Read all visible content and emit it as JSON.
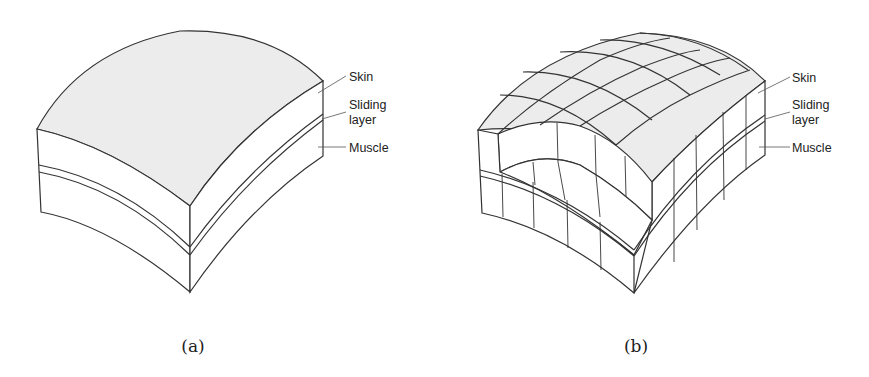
{
  "figure": {
    "panels": [
      {
        "id": "a",
        "caption": "(a)",
        "description": "Continuous curved tissue block with three layers",
        "labels": {
          "skin": "Skin",
          "sliding_line1": "Sliding",
          "sliding_line2": "layer",
          "muscle": "Muscle"
        }
      },
      {
        "id": "b",
        "caption": "(b)",
        "description": "Discretized curved tissue block (grid of elements) with a cut-away corner",
        "labels": {
          "skin": "Skin",
          "sliding_line1": "Sliding",
          "sliding_line2": "layer",
          "muscle": "Muscle"
        }
      }
    ],
    "colors": {
      "top_surface": "#ececec",
      "side_surface": "#ffffff",
      "stroke": "#333333"
    }
  }
}
